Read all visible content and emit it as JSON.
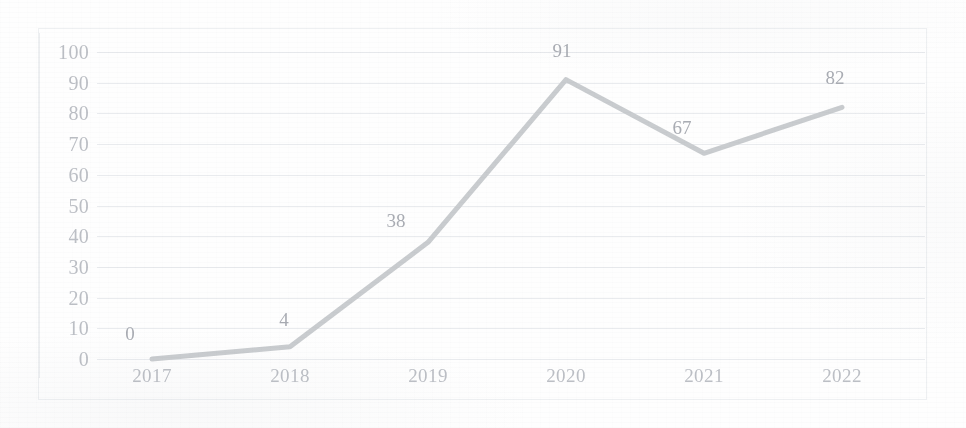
{
  "chart_data": {
    "type": "line",
    "title": "",
    "subtitle": "",
    "xlabel": "",
    "ylabel": "",
    "categories": [
      "2017",
      "2018",
      "2019",
      "2020",
      "2021",
      "2022"
    ],
    "values": [
      0,
      4,
      38,
      91,
      67,
      82
    ],
    "point_labels": [
      "0",
      "4",
      "38",
      "91",
      "67",
      "82"
    ],
    "series": [
      {
        "name": "",
        "values": [
          0,
          4,
          38,
          91,
          67,
          82
        ]
      }
    ],
    "ylim": [
      0,
      100
    ],
    "ytick_step": 10,
    "yticks": [
      "100",
      "90",
      "80",
      "70",
      "60",
      "50",
      "40",
      "30",
      "20",
      "10",
      "0"
    ],
    "ytick_values": [
      100,
      90,
      80,
      70,
      60,
      50,
      40,
      30,
      20,
      10,
      0
    ],
    "grid": true,
    "grid_axis": "y",
    "legend": false,
    "legend_position": "none",
    "data_labels_shown": true,
    "markers": false
  },
  "style": {
    "line_color": "#c9cccf",
    "grid_color": "#e9ebee",
    "frame_color": "#eef0f2",
    "axis_color": "#eceef0",
    "tick_text_color": "#bcbfc5",
    "value_text_color": "#a9acb3",
    "background_color": "#fefefe",
    "line_width": 5
  }
}
